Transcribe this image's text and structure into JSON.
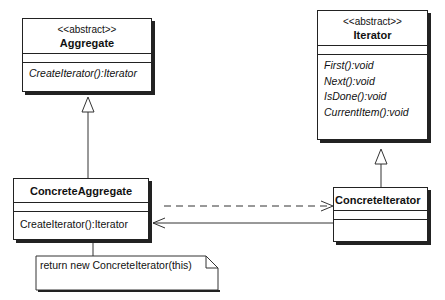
{
  "diagram": {
    "type": "UML class diagram",
    "pattern": "Iterator",
    "classes": {
      "aggregate": {
        "stereotype": "<<abstract>>",
        "name": "Aggregate",
        "operations": [
          "CreateIterator():Iterator"
        ]
      },
      "iterator": {
        "stereotype": "<<abstract>>",
        "name": "Iterator",
        "operations": [
          "First():void",
          "Next():void",
          "IsDone():void",
          "CurrentItem():void"
        ]
      },
      "concrete_aggregate": {
        "name": "ConcreteAggregate",
        "operations": [
          "CreateIterator():Iterator"
        ]
      },
      "concrete_iterator": {
        "name": "ConcreteIterator",
        "operations": []
      }
    },
    "note": {
      "text": "return new ConcreteIterator(this)"
    },
    "relationships": [
      {
        "from": "ConcreteAggregate",
        "to": "Aggregate",
        "kind": "generalization"
      },
      {
        "from": "ConcreteIterator",
        "to": "Iterator",
        "kind": "generalization"
      },
      {
        "from": "ConcreteAggregate",
        "to": "ConcreteIterator",
        "kind": "dependency"
      },
      {
        "from": "ConcreteIterator",
        "to": "ConcreteAggregate",
        "kind": "association"
      }
    ]
  }
}
